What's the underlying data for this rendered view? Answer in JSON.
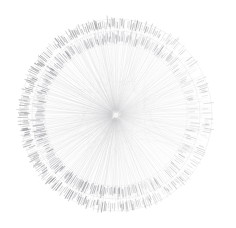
{
  "figure": {
    "name": "radial-edge-bundling-graph",
    "type": "radial-node-link-diagram",
    "title": "",
    "background_color": "#ffffff",
    "canvas": {
      "width": 236,
      "height": 228
    }
  },
  "chart_data": {
    "type": "scatter",
    "title": "",
    "subtitle": "",
    "xlabel": "",
    "ylabel": "",
    "legend": [],
    "annotations": [],
    "grid": false,
    "layout": "radial",
    "center": {
      "x": 116,
      "y": 115
    },
    "outer_radius": 97,
    "structure": {
      "description": "Dense radial spoke bundle converging on center, enclosed by two concentric annular bands of short radial tick marks",
      "spoke_count": 260,
      "spoke_color": "#b9b9bd",
      "spoke_opacity_range": [
        0.05,
        0.3
      ],
      "spoke_inner_radius": 2,
      "spoke_outer_radius": 95
    },
    "rings": [
      {
        "name": "outer-tick-ring",
        "inner_radius": 86,
        "outer_radius": 97,
        "tick_count": 300,
        "tick_color": "#8c8c92",
        "base_opacity": 0.55
      },
      {
        "name": "inner-tick-ring",
        "inner_radius": 71,
        "outer_radius": 83,
        "tick_count": 280,
        "tick_color": "#90909a",
        "base_opacity": 0.5
      }
    ],
    "ring_outlines": [
      {
        "name": "outer-ring-guide",
        "radius": 96,
        "color": "#c8c8cc",
        "opacity": 0.35
      },
      {
        "name": "mid-ring-guide",
        "radius": 84,
        "color": "#c8c8cc",
        "opacity": 0.3
      },
      {
        "name": "inner-ring-guide",
        "radius": 71,
        "color": "#cfcfd3",
        "opacity": 0.25
      }
    ],
    "density_profile": {
      "description": "Tick darkness varies with angle; heaviest in the upper-left and left sectors, lightest on the right",
      "peak_angle_deg": 205,
      "secondary_peak_angle_deg": 140,
      "min_angle_deg": 10
    },
    "core": {
      "name": "center-convergence",
      "radius": 26,
      "color": "#d0d0d4",
      "opacity": 0.22
    },
    "colors": {
      "background": "#ffffff",
      "ink": "#8c8c92",
      "faint_ink": "#cfcfd3"
    }
  }
}
